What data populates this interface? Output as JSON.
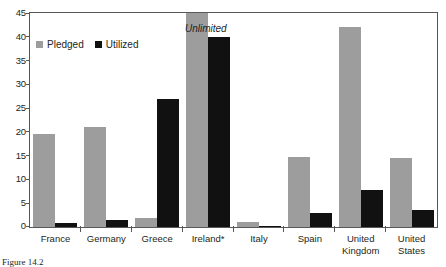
{
  "chart_data": {
    "type": "bar",
    "title": "",
    "xlabel": "",
    "ylabel": "",
    "ylim": [
      0,
      45
    ],
    "yticks": [
      0,
      5,
      10,
      15,
      20,
      25,
      30,
      35,
      40,
      45
    ],
    "grid": false,
    "legend_position": "top-left",
    "categories": [
      "France",
      "Germany",
      "Greece",
      "Ireland*",
      "Italy",
      "Spain",
      "United\nKingdom",
      "United\nStates"
    ],
    "series": [
      {
        "name": "Pledged",
        "color": "#9d9d9d",
        "values": [
          19.5,
          21,
          2,
          45,
          1,
          14.8,
          42,
          14.5
        ]
      },
      {
        "name": "Utilized",
        "color": "#111111",
        "values": [
          0.8,
          1.5,
          27,
          40,
          0.2,
          3,
          7.8,
          3.5
        ]
      }
    ],
    "annotations": [
      {
        "text": "Unlimited",
        "target_category": "Ireland*",
        "target_series": "Pledged",
        "note": "Ireland pledged amount is unlimited; bar is clipped at axis maximum"
      }
    ]
  },
  "legend": {
    "items": [
      {
        "label": "Pledged",
        "swatch": "pledged-swatch"
      },
      {
        "label": "Utilized",
        "swatch": "utilized-swatch"
      }
    ]
  },
  "caption": {
    "text": "Figure 14.2"
  }
}
